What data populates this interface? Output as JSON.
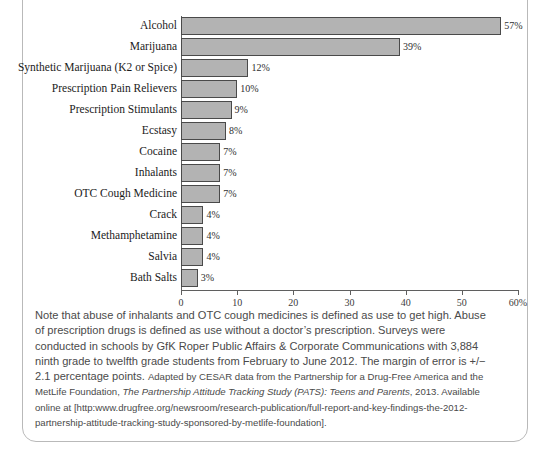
{
  "chart_data": {
    "type": "bar",
    "orientation": "horizontal",
    "title": "",
    "subtitle": "",
    "xlabel": "",
    "ylabel": "",
    "xlim": [
      0,
      60
    ],
    "grid": false,
    "legend": null,
    "axis_unit_suffix": "%",
    "tick_labels": [
      "0",
      "10",
      "20",
      "30",
      "40",
      "50",
      "60%"
    ],
    "tick_values": [
      0,
      10,
      20,
      30,
      40,
      50,
      60
    ],
    "categories": [
      "Alcohol",
      "Marijuana",
      "Synthetic Marijuana (K2 or Spice)",
      "Prescription Pain Relievers",
      "Prescription Stimulants",
      "Ecstasy",
      "Cocaine",
      "Inhalants",
      "OTC Cough Medicine",
      "Crack",
      "Methamphetamine",
      "Salvia",
      "Bath Salts"
    ],
    "values": [
      57,
      39,
      12,
      10,
      9,
      8,
      7,
      7,
      7,
      4,
      4,
      4,
      3
    ],
    "data_labels": [
      "57%",
      "39%",
      "12%",
      "10%",
      "9%",
      "8%",
      "7%",
      "7%",
      "7%",
      "4%",
      "4%",
      "4%",
      "3%"
    ],
    "bar_color": "#b3b3b3",
    "bar_edge_color": "#4a4a4a",
    "axis_color": "#5f5f5f"
  },
  "caption": {
    "part1": "Note that abuse of inhalants and OTC cough medicines is defined as use to get high. Abuse of prescription drugs is defined as use without a doctor’s prescription. Surveys were conducted in schools by GfK Roper Public Affairs & Corporate Communications with 3,884 ninth grade to twelfth grade students from February to June 2012. The margin of error is +/− 2.1 percentage points. ",
    "source_lead": "Adapted by CESAR data from the Partnership for a Drug-Free America and the MetLife Foundation, ",
    "source_italic": "The Partnership Attitude Tracking Study (PATS): Teens and Parents",
    "source_tail": ", 2013. Available online at [http:www.drugfree.org/newsroom/research-publication/full-report-and-key-findings-the-2012-partnership-attitude-tracking-study-sponsored-by-metlife-foundation]."
  }
}
